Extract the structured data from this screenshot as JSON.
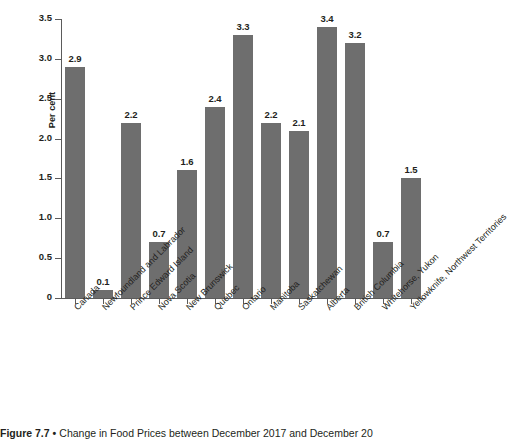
{
  "chart_data": {
    "type": "bar",
    "title": "Change in Food Prices between December 2017 and December 20",
    "xlabel": "",
    "ylabel": "Per cent",
    "ylim": [
      0,
      3.5
    ],
    "ytick_labels": [
      "0",
      "0.5",
      "1.0",
      "1.5",
      "2.0",
      "2.5",
      "3.0",
      "3.5"
    ],
    "ytick_values": [
      0,
      0.5,
      1.0,
      1.5,
      2.0,
      2.5,
      3.0,
      3.5
    ],
    "grid": false,
    "legend": "none",
    "bar_color": "#6e6e6e",
    "axis_color": "#5b5b5b",
    "categories": [
      "Canada",
      "Newfoundland and Labrador",
      "Prince Edward Island",
      "Nova Scotia",
      "New Brunswick",
      "Quebec",
      "Ontario",
      "Manitoba",
      "Saskatchewan",
      "Alberta",
      "British Columbia",
      "Whitehorse, Yukon",
      "Yellowknife, Northwest Territories"
    ],
    "values": [
      2.9,
      0.1,
      2.2,
      0.7,
      1.6,
      2.4,
      3.3,
      2.2,
      2.1,
      3.4,
      3.2,
      0.7,
      1.5
    ],
    "value_labels": [
      "2.9",
      "0.1",
      "2.2",
      "0.7",
      "1.6",
      "2.4",
      "3.3",
      "2.2",
      "2.1",
      "3.4",
      "3.2",
      "0.7",
      "1.5"
    ]
  },
  "caption": {
    "figure_number": "Figure 7.7",
    "separator": "•",
    "text": "Change in Food Prices between December 2017 and December 20"
  }
}
